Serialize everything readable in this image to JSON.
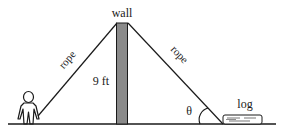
{
  "diagram": {
    "type": "geometry-word-problem",
    "labels": {
      "wall": "wall",
      "height": "9 ft",
      "rope_left": "rope",
      "rope_right": "rope",
      "angle": "θ",
      "log": "log"
    },
    "colors": {
      "wall_fill": "#8a8a8a",
      "stroke": "#1a1a1a",
      "background": "#ffffff"
    }
  }
}
